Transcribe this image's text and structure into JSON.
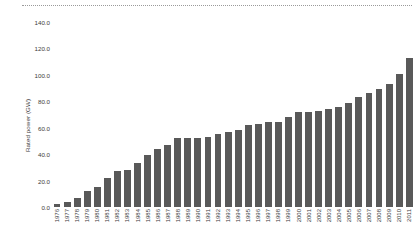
{
  "chart_data": {
    "type": "bar",
    "title": "",
    "xlabel": "",
    "ylabel": "Rated power (GW)",
    "ylim": [
      0,
      140
    ],
    "ytick_step": 20,
    "ytick_labels": [
      "140.0",
      "120.0",
      "100.0",
      "80.0",
      "60.0",
      "40.0",
      "20.0",
      "0.0"
    ],
    "ytick_values": [
      140,
      120,
      100,
      80,
      60,
      40,
      20,
      0
    ],
    "grid": false,
    "legend": null,
    "bar_color": "#595959",
    "categories": [
      "1976",
      "1977",
      "1978",
      "1979",
      "1980",
      "1981",
      "1982",
      "1983",
      "1984",
      "1985",
      "1986",
      "1987",
      "1988",
      "1989",
      "1990",
      "1991",
      "1992",
      "1993",
      "1994",
      "1995",
      "1996",
      "1997",
      "1998",
      "1999",
      "2000",
      "2001",
      "2002",
      "2003",
      "2004",
      "2005",
      "2006",
      "2007",
      "2008",
      "2009",
      "2010",
      "2011"
    ],
    "values": [
      2.0,
      4.0,
      7.0,
      12.0,
      15.0,
      22.0,
      27.0,
      28.0,
      33.0,
      39.0,
      44.0,
      47.0,
      52.0,
      52.0,
      52.0,
      53.0,
      55.0,
      57.0,
      58.0,
      62.0,
      63.0,
      64.0,
      64.0,
      68.0,
      72.0,
      72.0,
      73.0,
      74.0,
      76.0,
      79.0,
      83.0,
      86.0,
      89.0,
      93.0,
      101.0,
      113.0
    ]
  },
  "decorations": {
    "top_rule_style": "dotted"
  }
}
